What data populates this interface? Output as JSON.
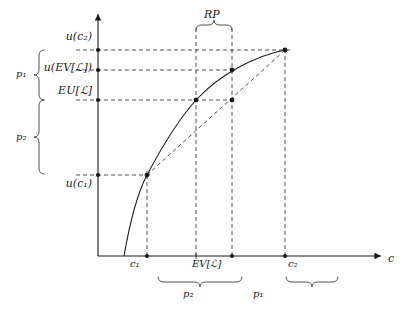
{
  "figure": {
    "type": "economics-utility-diagram",
    "axes": {
      "x_axis_label": "c",
      "y_axis_label": "",
      "x_axis_name": "consumption-axis",
      "y_axis_name": "utility-axis"
    },
    "y_labels": [
      {
        "text": "u(c₂)",
        "name": "u-c2-label",
        "y": 50
      },
      {
        "text": "u(EV[ℒ])",
        "name": "u-ev-label",
        "y": 70
      },
      {
        "text": "EU[ℒ]",
        "name": "eu-label",
        "y": 100
      },
      {
        "text": "u(c₁)",
        "name": "u-c1-label",
        "y": 175
      }
    ],
    "x_labels": [
      {
        "text": "c₁",
        "name": "c1-label",
        "x": 147
      },
      {
        "text": "EV[ℒ]",
        "name": "ev-label",
        "x": 214
      },
      {
        "text": "c₂",
        "name": "c2-label",
        "x": 285
      }
    ],
    "braces": {
      "left_upper": {
        "label": "p₁",
        "name": "brace-p1-left",
        "from": 50,
        "to": 100
      },
      "left_lower": {
        "label": "p₂",
        "name": "brace-p2-left",
        "from": 100,
        "to": 175
      },
      "bottom_left": {
        "label": "p₂",
        "name": "brace-p2-bottom",
        "from": 147,
        "to": 232
      },
      "bottom_right": {
        "label": "p₁",
        "name": "brace-p1-bottom",
        "from": 232,
        "to": 285
      },
      "top": {
        "label": "RP",
        "name": "brace-rp-top",
        "from": 196,
        "to": 232
      }
    },
    "points": [
      {
        "name": "point-c1-curve",
        "x": 147,
        "y": 175
      },
      {
        "name": "point-ev-curve",
        "x": 196,
        "y": 100
      },
      {
        "name": "point-ce-chord",
        "x": 232,
        "y": 100
      },
      {
        "name": "point-ev-chord",
        "x": 232,
        "y": 70
      },
      {
        "name": "point-c2-curve",
        "x": 285,
        "y": 50
      }
    ],
    "colors": {
      "line": "#1a1a1a",
      "dashed": "#3c3c3c",
      "background": "#ffffff"
    }
  }
}
